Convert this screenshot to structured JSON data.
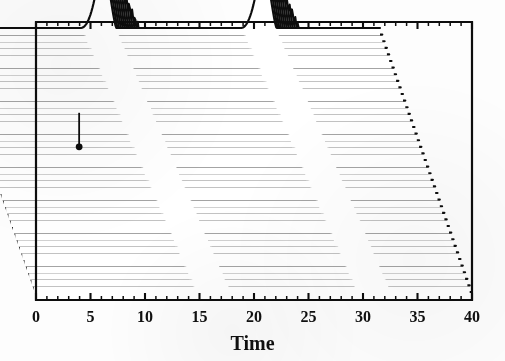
{
  "figure": {
    "background_color": "#ffffff",
    "ink_color": "#0d0d0d",
    "frame": {
      "left_px": 36,
      "right_px": 472,
      "top_px": 22,
      "bottom_px": 300
    }
  },
  "axis": {
    "title": "Time",
    "tick_labels": [
      "0",
      "5",
      "10",
      "15",
      "20",
      "25",
      "30",
      "35",
      "40"
    ],
    "tick_values": [
      0,
      5,
      10,
      15,
      20,
      25,
      30,
      35,
      40
    ],
    "minor_tick_step": 1,
    "tick_direction": "inward"
  },
  "annotation": {
    "marker": "vertical-tick-marker",
    "x_value": 8.6,
    "trace_index": 22
  },
  "chart_data": {
    "type": "line",
    "subtype": "waterfall-stacked-traces",
    "title": "",
    "xlabel": "Time",
    "ylabel": "",
    "xlim": [
      0,
      40
    ],
    "ylim": [
      0,
      1
    ],
    "grid": false,
    "legend": null,
    "n_traces": 41,
    "trace_vertical_step_px": 6.6,
    "trace_horizontal_skew_px": 2.3,
    "baseline_level": 0.0,
    "peak_amplitude": 1.0,
    "peaks": [
      {
        "name": "peak-1",
        "apex_time_top_trace": 14.6,
        "apex_time_bottom_trace": 16.7,
        "rise_width": 2.1,
        "fall_width": 1.2
      },
      {
        "name": "peak-2",
        "apex_time_top_trace": 29.3,
        "apex_time_bottom_trace": 31.4,
        "rise_width": 2.1,
        "fall_width": 1.2
      }
    ],
    "series": [
      {
        "name": "trace-top",
        "index": 40,
        "peak_times": [
          14.6,
          29.3
        ]
      },
      {
        "name": "trace-bottom",
        "index": 0,
        "peak_times": [
          16.7,
          31.4
        ]
      }
    ],
    "x": [
      0,
      5,
      10,
      15,
      20,
      25,
      30,
      35,
      40
    ],
    "values": [
      0,
      0,
      0,
      1,
      0,
      0,
      1,
      0,
      0
    ]
  }
}
